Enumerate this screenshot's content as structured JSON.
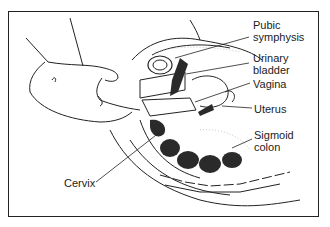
{
  "figure": {
    "labels": {
      "pubic_symphysis": "Pubic\nsymphysis",
      "urinary_bladder": "Urinary\nbladder",
      "vagina": "Vagina",
      "uterus": "Uterus",
      "sigmoid_colon": "Sigmoid\ncolon",
      "cervix": "Cervix"
    },
    "colors": {
      "line": "#222222",
      "dark_fill": "#2a2a2a",
      "stipple": "#bbbbbb",
      "background": "#ffffff"
    }
  }
}
